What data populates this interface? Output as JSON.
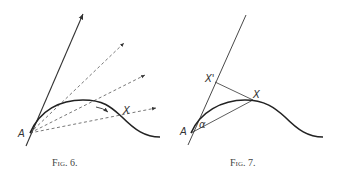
{
  "figures": [
    {
      "caption": "Fig. 6.",
      "labels": {
        "point_a": "A",
        "point_x": "X"
      },
      "description": "Curve from A with tangent line and dashed secant rays through points on curve"
    },
    {
      "caption": "Fig. 7.",
      "labels": {
        "point_a": "A",
        "point_x": "X",
        "point_x_prime": "X'",
        "angle": "α"
      },
      "description": "Curve from A with tangent line, chord AX at angle α, and perpendicular from X to tangent at X'"
    }
  ],
  "colors": {
    "stroke": "#222222",
    "dashed": "#555555",
    "text": "#333333"
  }
}
